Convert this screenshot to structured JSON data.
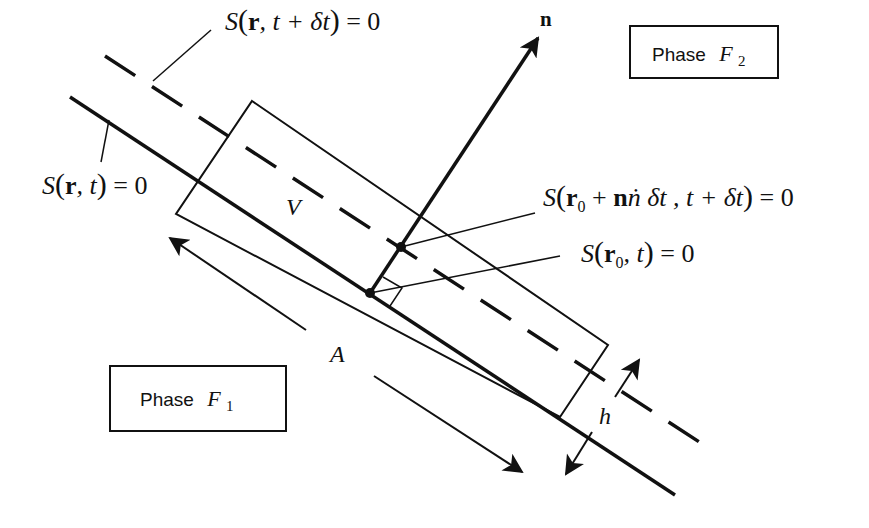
{
  "diagram": {
    "colors": {
      "ink": "#111111",
      "background": "#ffffff"
    },
    "phases": {
      "upper": {
        "word": "Phase",
        "symbol": "F",
        "subscript": "2"
      },
      "lower": {
        "word": "Phase",
        "symbol": "F",
        "subscript": "1"
      }
    },
    "labels": {
      "surface_later": {
        "S": "S",
        "open": "(",
        "r": "r",
        "rest": ", t + δt",
        "close": ")",
        "eq": " = 0"
      },
      "surface_now": {
        "S": "S",
        "open": "(",
        "r": "r",
        "rest": ", t",
        "close": ")",
        "eq": " = 0"
      },
      "point_later": {
        "S": "S",
        "open": "(",
        "r": "r",
        "sub": "0",
        "plus": " + ",
        "n": "n",
        "ndot": "ṅ",
        "rest": " δt , t + δt",
        "close": ")",
        "eq": " = 0"
      },
      "point_now": {
        "S": "S",
        "open": "(",
        "r": "r",
        "sub": "0",
        "rest": ", t",
        "close": ")",
        "eq": " = 0"
      },
      "normal": "n",
      "volume": "V",
      "area": "A",
      "thickness": "h"
    }
  }
}
